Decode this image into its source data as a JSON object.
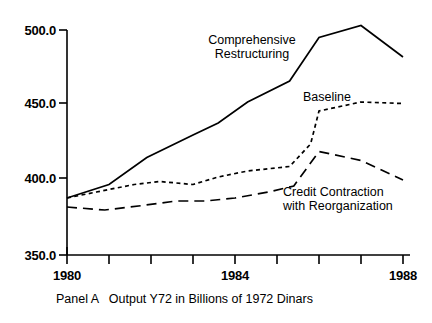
{
  "figure": {
    "caption": "Panel A   Output Y72 in Billions of 1972 Dinars",
    "background_color": "#ffffff",
    "line_color": "#000000"
  },
  "chart_data": {
    "type": "line",
    "title": "",
    "subtitle": "",
    "caption": "Panel A   Output Y72 in Billions of 1972 Dinars",
    "xlabel": "",
    "ylabel": "",
    "xlim": [
      1980,
      1988
    ],
    "ylim": [
      350.0,
      500.0
    ],
    "grid": false,
    "legend": "inline-annotations",
    "x": [
      1980,
      1981,
      1982,
      1983,
      1984,
      1985,
      1986,
      1987,
      1988
    ],
    "xtick_values": [
      1980,
      1981,
      1982,
      1983,
      1984,
      1985,
      1986,
      1987,
      1988
    ],
    "xtick_labels": [
      "1980",
      "",
      "",
      "",
      "1984",
      "",
      "",
      "",
      "1988"
    ],
    "xtick_labels_shown": [
      "1980",
      "1984",
      "1988"
    ],
    "ytick_values": [
      350.0,
      400.0,
      450.0,
      500.0
    ],
    "ytick_labels": [
      "350.0",
      "400.0",
      "450.0",
      "500.0"
    ],
    "series": [
      {
        "name": "Comprehensive Restructuring",
        "style": "solid",
        "label_line1": "Comprehensive",
        "label_line2": "Restructuring",
        "values": [
          388,
          397,
          415,
          430,
          438,
          452,
          466,
          495,
          503,
          482
        ],
        "x_values": [
          1980,
          1981,
          1981.9,
          1983,
          1983.6,
          1984.3,
          1985.3,
          1986,
          1987,
          1988
        ]
      },
      {
        "name": "Baseline",
        "style": "dotted",
        "label_line1": "Baseline",
        "label_line2": "",
        "values": [
          388,
          392,
          397,
          399,
          397,
          402,
          406,
          409,
          424,
          446,
          452,
          451
        ],
        "x_values": [
          1980,
          1980.7,
          1981.6,
          1982.2,
          1983,
          1983.6,
          1984.3,
          1985.3,
          1985.8,
          1986,
          1987,
          1988
        ]
      },
      {
        "name": "Credit Contraction with Reorganization",
        "style": "dashed",
        "label_line1": "Credit Contraction",
        "label_line2": "with Reorganization",
        "values": [
          382,
          380,
          383,
          386,
          386,
          388,
          392,
          396,
          419,
          413,
          400
        ],
        "x_values": [
          1980,
          1980.9,
          1981.8,
          1982.6,
          1983.3,
          1984,
          1984.8,
          1985.4,
          1986,
          1987,
          1988
        ]
      }
    ]
  },
  "axes": {
    "y_ticks": [
      {
        "label": "500.0",
        "value": 500.0
      },
      {
        "label": "450.0",
        "value": 450.0
      },
      {
        "label": "400.0",
        "value": 400.0
      },
      {
        "label": "350.0",
        "value": 350.0
      }
    ],
    "x_ticks": [
      {
        "label": "1980",
        "value": 1980
      },
      {
        "label": "1984",
        "value": 1984
      },
      {
        "label": "1988",
        "value": 1988
      }
    ]
  },
  "annotations": {
    "comprehensive_line1": "Comprehensive",
    "comprehensive_line2": "Restructuring",
    "baseline": "Baseline",
    "credit_line1": "Credit Contraction",
    "credit_line2": "with Reorganization"
  }
}
